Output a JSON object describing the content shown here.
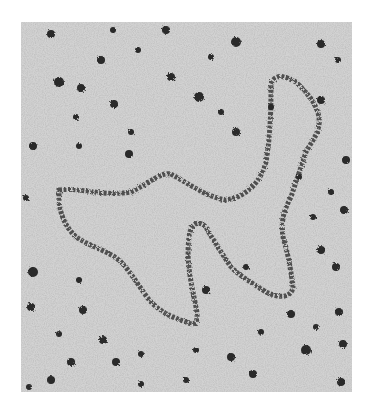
{
  "image": {
    "description": "Grayscale electron micrograph showing a long looping dark strand (molecule) on a grainy light-gray background with scattered dark star-shaped particles",
    "colors": {
      "background": "#ffffff",
      "field": "#c9c9c9",
      "strand": "#3a3a3a",
      "particle": "#2a2a2a"
    }
  }
}
